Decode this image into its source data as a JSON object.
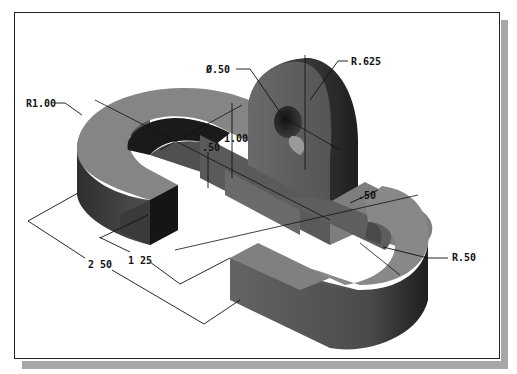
{
  "drawing": {
    "title": "Isometric view of double U-bracket with upright lug",
    "colors": {
      "frame_border": "#222222",
      "shadow": "#a8a8a8",
      "body_top": "#8a8a8a",
      "body_side_light": "#6e6e6e",
      "body_side_dark": "#3a3a3a",
      "dimension_line": "#111111"
    },
    "dimensions": [
      {
        "id": "left-radius",
        "label": "R1.00"
      },
      {
        "id": "hole-diameter",
        "label": "Ø.50"
      },
      {
        "id": "lug-radius",
        "label": "R.625"
      },
      {
        "id": "lug-height",
        "label": "1.00"
      },
      {
        "id": "base-thickness",
        "label": ".50"
      },
      {
        "id": "slot-width",
        "label": ".50"
      },
      {
        "id": "right-radius",
        "label": "R.50"
      },
      {
        "id": "inner-length",
        "label": "1 25"
      },
      {
        "id": "overall-length",
        "label": "2 50"
      }
    ]
  }
}
